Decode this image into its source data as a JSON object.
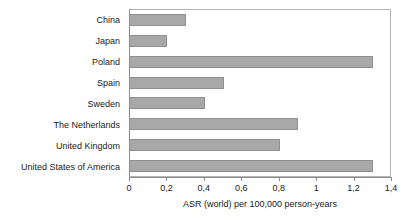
{
  "chart_data": {
    "type": "bar",
    "orientation": "horizontal",
    "title": "",
    "xlabel": "ASR (world) per 100,000 person-years",
    "ylabel": "",
    "categories": [
      "China",
      "Japan",
      "Poland",
      "Spain",
      "Sweden",
      "The Netherlands",
      "United Kingdom",
      "United States of America"
    ],
    "values": [
      0.3,
      0.2,
      1.3,
      0.5,
      0.4,
      0.9,
      0.8,
      1.3
    ],
    "xlim": [
      0,
      1.4
    ],
    "xticks": [
      0,
      0.2,
      0.4,
      0.6,
      0.8,
      1,
      1.2,
      1.4
    ],
    "xtick_labels": [
      "0",
      "0,2",
      "0,4",
      "0,6",
      "0,8",
      "1",
      "1,2",
      "1,4"
    ],
    "grid": false,
    "legend": null,
    "bar_color": "#a8a8a8",
    "bar_border_color": "#8f8f8f",
    "axis_color": "#8d8d8d",
    "text_color": "#1a1a1a",
    "background": "#ffffff"
  }
}
